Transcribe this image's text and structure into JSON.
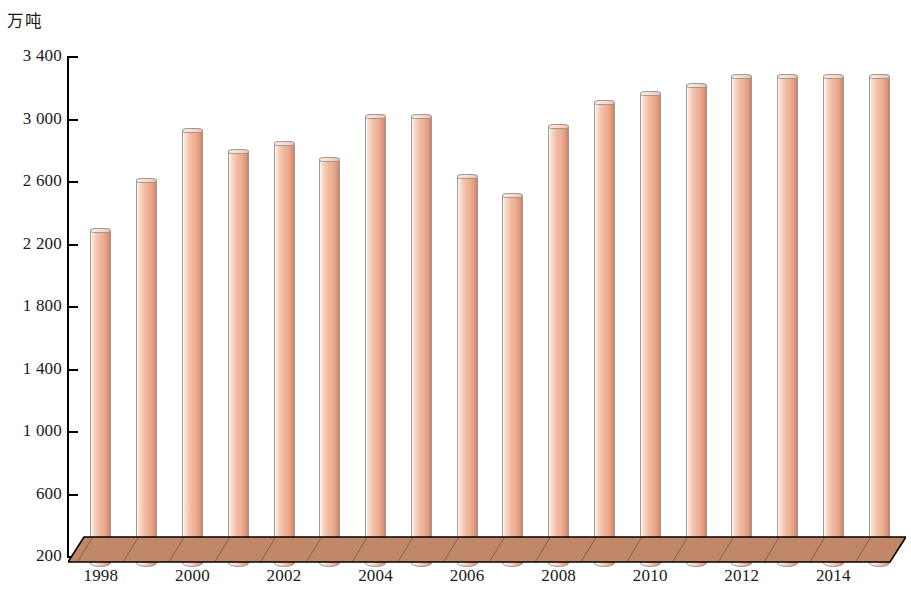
{
  "chart_data": {
    "type": "bar",
    "title": "",
    "subtitle": "",
    "xlabel": "",
    "ylabel": "万吨",
    "unit_label": "万吨",
    "ylim": [
      200,
      3400
    ],
    "ytick_step": 400,
    "yticks": [
      "3 400",
      "3 000",
      "2 600",
      "2 200",
      "1 800",
      "1 400",
      "1 000",
      "600",
      "200"
    ],
    "ytick_values": [
      3400,
      3000,
      2600,
      2200,
      1800,
      1400,
      1000,
      600,
      200
    ],
    "grid": false,
    "legend": null,
    "categories": [
      "1998",
      "1999",
      "2000",
      "2001",
      "2002",
      "2003",
      "2004",
      "2005",
      "2006",
      "2007",
      "2008",
      "2009",
      "2010",
      "2011",
      "2012",
      "2013",
      "2014",
      "2015"
    ],
    "xtick_labels": [
      "1998",
      "2000",
      "2002",
      "2004",
      "2006",
      "2008",
      "2010",
      "2012",
      "2014"
    ],
    "values": [
      2290,
      2610,
      2930,
      2800,
      2850,
      2750,
      3020,
      3020,
      2640,
      2520,
      2960,
      3110,
      3170,
      3220,
      3280,
      3280,
      3280,
      3280
    ],
    "series": [
      {
        "name": "产量",
        "values": [
          2290,
          2610,
          2930,
          2800,
          2850,
          2750,
          3020,
          3020,
          2640,
          2520,
          2960,
          3110,
          3170,
          3220,
          3280,
          3280,
          3280,
          3280
        ]
      }
    ],
    "colors": {
      "bar_fill_light": "#fbe3d6",
      "bar_fill_mid": "#f0b99f",
      "bar_fill_dark": "#c97f60",
      "bar_outline": "#9a9a9a",
      "platform_top": "#c08768",
      "platform_face": "#c08768",
      "platform_outline": "#000000",
      "axis": "#000000",
      "background": "#ffffff"
    }
  },
  "axis": {
    "unit": "万吨"
  }
}
